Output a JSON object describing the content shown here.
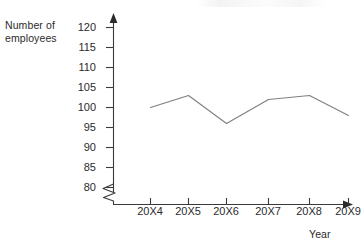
{
  "chart_data": {
    "type": "line",
    "title": "",
    "subtitle": "",
    "xlabel": "Year",
    "ylabel": "Number of employees",
    "categories": [
      "20X4",
      "20X5",
      "20X6",
      "20X7",
      "20X8",
      "20X9"
    ],
    "series": [
      {
        "name": "Number of employees",
        "values": [
          100,
          103,
          96,
          102,
          103,
          98
        ],
        "color": "#808080"
      }
    ],
    "ylim": [
      80,
      120
    ],
    "y_ticks": [
      120,
      115,
      110,
      105,
      100,
      95,
      90,
      85,
      80
    ],
    "y_tick_labels": [
      "120",
      "115",
      "110",
      "105",
      "100",
      "95",
      "90",
      "85",
      "80"
    ],
    "x_tick_labels": [
      "20X4",
      "20X5",
      "20X6",
      "20X7",
      "20X8",
      "20X9"
    ],
    "grid": false,
    "legend": "none",
    "axis_break": true,
    "axis_break_note": "zigzag break on y-axis below 80",
    "markers": false,
    "axis_arrows": true
  },
  "axes": {
    "y_title": "Number of\nemployees",
    "x_title": "Year"
  },
  "colors": {
    "line": "#808080",
    "axis": "#3a3a3a",
    "text": "#2b2b2b",
    "background": "#ffffff"
  }
}
